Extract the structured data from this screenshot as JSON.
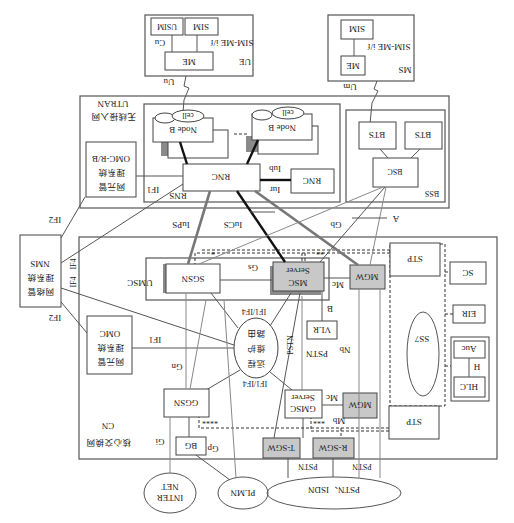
{
  "diagram": {
    "orientation": "rotated-180",
    "caption": "",
    "regions": {
      "cn": {
        "label_cn": "核心交换网",
        "label_en": "CN"
      },
      "utran": {
        "label_cn": "无线接入网",
        "label_en": "UTRAN"
      },
      "rns": {
        "label": "RNS"
      },
      "bss": {
        "label": "BSS"
      },
      "umsc": {
        "label": "UMSC"
      },
      "ue": {
        "label": "UE"
      },
      "ms": {
        "label": "MS"
      },
      "ss7": {
        "label": "SS7"
      }
    },
    "nodes": {
      "ue_me": "ME",
      "ue_sim": "SIM",
      "ue_usim": "USIM",
      "ue_sim_me_if": "SIM-ME i/f",
      "ue_cu": "Cu",
      "ms_me": "ME",
      "ms_sim": "SIM",
      "ms_sim_me_if": "SIM-ME i/f",
      "nodeb1": "Node B",
      "nodeb2": "Node B",
      "cell1": "cell",
      "cell2": "cell",
      "rnc_main": "RNC",
      "rnc_other": "RNC",
      "bts1": "BTS",
      "bts2": "BTS",
      "bsc": "BSC",
      "omc_rb_line1": "网元管",
      "omc_rb_line2": "理系统",
      "omc_rb_line3": "OMC-R/B",
      "nms_line1": "网络管",
      "nms_line2": "理系统",
      "nms_line3": "NMS",
      "omc_line1": "网元管",
      "omc_line2": "理系统",
      "omc_line3": "OMC",
      "sgsn": "SGSN",
      "msc_server_line1": "MSC",
      "msc_server_line2": "Server",
      "mgw_top": "MGW",
      "stp_top": "STP",
      "sc": "SC",
      "eir": "EIR",
      "auc": "Auc",
      "hlr_h": "H",
      "hlr": "HLC",
      "vlr": "VLR",
      "remote_line1": "远程",
      "remote_line2": "维护",
      "remote_line3": "路由",
      "ggsn": "GGSN",
      "gmsc_line1": "GMSC",
      "gmsc_line2": "Server",
      "mgw_bottom": "MGW",
      "stp_bottom": "STP",
      "bg": "BG",
      "tsgw": "T-SGW",
      "rsgw": "R-SGW",
      "internet_line1": "INTER",
      "internet_line2": "NET",
      "plmn": "PLMN",
      "pstn_isdn": "PSTN、ISDN"
    },
    "interfaces": {
      "uu": "Uu",
      "um": "Um",
      "iub": "Iub",
      "iur": "Iur",
      "iups": "IuPS",
      "iucs": "IuCS",
      "gb": "Gb",
      "a": "A",
      "gs": "Gs",
      "mc_top": "Mc",
      "mc_bottom": "Mc",
      "b": "B",
      "nb": "Nb",
      "mb": "Mb",
      "gn": "Gn",
      "gi": "Gi",
      "gp": "Gp",
      "if1_rns": "IF1",
      "if1_omc": "IF1",
      "if2_top": "IF2",
      "if2_bottom": "IF2",
      "if4_a": "IF4",
      "if4_b": "IF4",
      "if1if4_top": "IF1/IF4",
      "if1if4_bottom": "IF1/IF4",
      "pstn_1": "PSTN",
      "pstn_2": "PSTN",
      "pstn_3": "PSTN",
      "pstn_4": "PSTN",
      "star1": "*",
      "star2": "**",
      "star3": "***",
      "star4": "****"
    },
    "colors": {
      "line": "#333333",
      "gray_box": "#c8c8c8",
      "shadow": "#8a8a8a",
      "background": "#ffffff"
    }
  }
}
